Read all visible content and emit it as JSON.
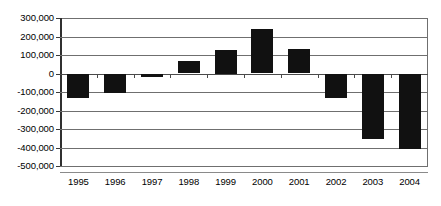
{
  "chart_data": {
    "type": "bar",
    "title": "",
    "subtitle": "",
    "xlabel": "",
    "ylabel": "",
    "categories": [
      "1995",
      "1996",
      "1997",
      "1998",
      "1999",
      "2000",
      "2001",
      "2002",
      "2003",
      "2004"
    ],
    "values": [
      -135000,
      -105000,
      -20000,
      65000,
      125000,
      240000,
      130000,
      -130000,
      -355000,
      -410000
    ],
    "series": [
      {
        "name": "",
        "values": [
          -135000,
          -105000,
          -20000,
          65000,
          125000,
          240000,
          130000,
          -130000,
          -355000,
          -410000
        ]
      }
    ],
    "ylim": [
      -500000,
      300000
    ],
    "ytick_values": [
      300000,
      200000,
      100000,
      0,
      -100000,
      -200000,
      -300000,
      -400000,
      -500000
    ],
    "ytick_labels": [
      "300,000",
      "200,000",
      "100,000",
      "0",
      "-100,000",
      "-200,000",
      "-300,000",
      "-400,000",
      "-500,000"
    ],
    "grid": true,
    "legend": false,
    "legend_position": "none",
    "bar_color": "#111111",
    "gridline_color": "#6f6f6f",
    "axis_color": "#303030",
    "background_color": "#ffffff",
    "annotations": []
  }
}
